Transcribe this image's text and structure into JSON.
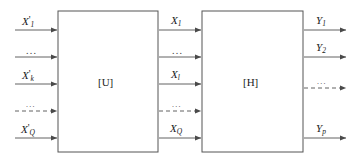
{
  "diagram": {
    "type": "block-diagram",
    "background_color": "#ffffff",
    "line_color": "#555555",
    "text_color": "#1a1a1a",
    "blocks": [
      {
        "id": "block-u",
        "label": "[U]",
        "x": 58,
        "y": 11,
        "width": 100,
        "height": 141
      },
      {
        "id": "block-h",
        "label": "[H]",
        "x": 202,
        "y": 11,
        "width": 101,
        "height": 141
      }
    ],
    "input_signals": [
      {
        "id": "in-1",
        "base": "X",
        "prime": "'",
        "sub": "1",
        "y": 30,
        "style": "solid"
      },
      {
        "id": "in-2",
        "base": "",
        "prime": "",
        "sub": "",
        "text": "...",
        "y": 57,
        "style": "solid"
      },
      {
        "id": "in-3",
        "base": "X",
        "prime": "'",
        "sub": "k",
        "y": 84,
        "style": "solid"
      },
      {
        "id": "in-4",
        "base": "",
        "prime": "",
        "sub": "",
        "text": "...",
        "y": 111,
        "style": "dashed"
      },
      {
        "id": "in-5",
        "base": "X",
        "prime": "'",
        "sub": "Q",
        "y": 138,
        "style": "solid"
      }
    ],
    "middle_signals": [
      {
        "id": "mid-1",
        "base": "X",
        "prime": "",
        "sub": "1",
        "y": 30,
        "style": "solid"
      },
      {
        "id": "mid-2",
        "base": "",
        "prime": "",
        "sub": "",
        "text": "...",
        "y": 57,
        "style": "solid"
      },
      {
        "id": "mid-3",
        "base": "X",
        "prime": "",
        "sub": "l",
        "y": 84,
        "style": "solid"
      },
      {
        "id": "mid-4",
        "base": "",
        "prime": "",
        "sub": "",
        "text": "...",
        "y": 111,
        "style": "dashed"
      },
      {
        "id": "mid-5",
        "base": "X",
        "prime": "",
        "sub": "Q",
        "y": 138,
        "style": "solid"
      }
    ],
    "output_signals": [
      {
        "id": "out-1",
        "base": "Y",
        "prime": "",
        "sub": "1",
        "y": 30,
        "style": "solid"
      },
      {
        "id": "out-2",
        "base": "Y",
        "prime": "",
        "sub": "2",
        "y": 57,
        "style": "solid"
      },
      {
        "id": "out-3",
        "base": "",
        "prime": "",
        "sub": "",
        "text": "...",
        "y": 88,
        "style": "dashed"
      },
      {
        "id": "out-4",
        "base": "Y",
        "prime": "",
        "sub": "p",
        "y": 138,
        "style": "solid"
      }
    ]
  }
}
